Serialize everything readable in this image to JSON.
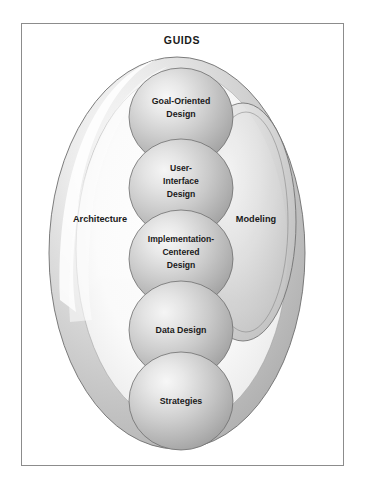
{
  "figure": {
    "title": "GUIDS",
    "frame": {
      "stroke": "#8c8c8c",
      "background": "#ffffff"
    },
    "outer_region": {
      "name": "outer-ellipse",
      "label": "",
      "fill_light": "#f2f2f2",
      "fill_mid": "#c9c9c9",
      "fill_dark": "#a8a8a8",
      "stroke": "#6e6e6e"
    },
    "side_labels": [
      {
        "id": "architecture",
        "text": "Architecture"
      },
      {
        "id": "modeling",
        "text": "Modeling"
      }
    ],
    "right_region": {
      "name": "modeling-ellipse",
      "fill_light": "#ededed",
      "fill_mid": "#c4c4c4",
      "stroke": "#6e6e6e"
    },
    "spheres": [
      {
        "id": "goal-oriented-design",
        "lines": [
          "Goal-Oriented",
          "Design"
        ]
      },
      {
        "id": "user-interface-design",
        "lines": [
          "User-",
          "Interface",
          "Design"
        ]
      },
      {
        "id": "implementation-centered-design",
        "lines": [
          "Implementation-",
          "Centered",
          "Design"
        ]
      },
      {
        "id": "data-design",
        "lines": [
          "Data Design"
        ]
      },
      {
        "id": "strategies",
        "lines": [
          "Strategies"
        ]
      }
    ],
    "colors": {
      "text": "#1a1a1a",
      "sphere_highlight": "#f0f0f0",
      "sphere_mid": "#bdbdbd",
      "sphere_shadow": "#9a9a9a",
      "sphere_stroke": "#6e6e6e"
    }
  }
}
